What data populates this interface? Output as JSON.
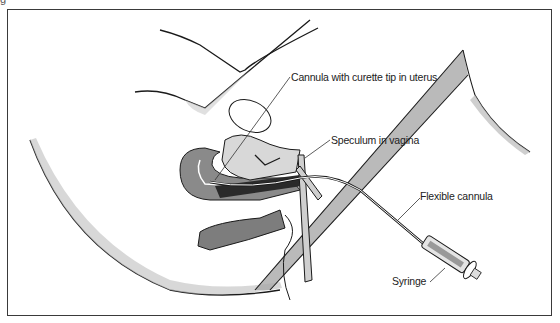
{
  "figure": {
    "corner_mark": "g"
  },
  "labels": {
    "cannula_curette": "Cannula with curette tip in uterus",
    "speculum": "Speculum in vagina",
    "flexible_cannula": "Flexible cannula",
    "syringe": "Syringe"
  },
  "colors": {
    "line": "#1a1a1a",
    "shade": "#9a9a9a",
    "tissue": "#7d7d7d",
    "dark": "#2a2a2a",
    "frame": "#3a3a3a"
  }
}
